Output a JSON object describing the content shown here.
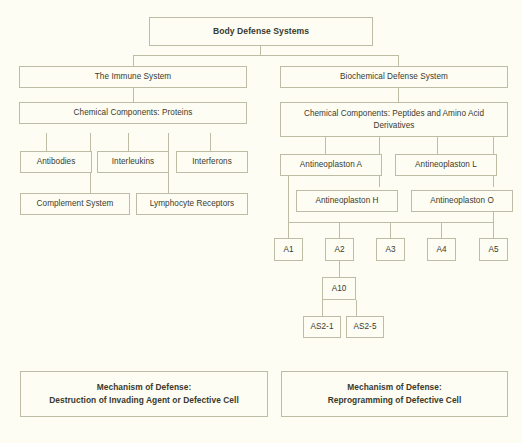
{
  "diagram": {
    "title": "Body Defense Systems",
    "type": "hierarchy-tree",
    "background_color": "#fdfdf3",
    "border_color": "#bdbda6",
    "text_color": "#3a3a2e",
    "nodes": {
      "root": "Body Defense Systems",
      "immune_system": "The Immune System",
      "biochemical_defense": "Biochemical Defense System",
      "chem_proteins": "Chemical Components: Proteins",
      "chem_peptides": "Chemical Components: Peptides and Amino Acid Derivatives",
      "antibodies": "Antibodies",
      "interleukins": "Interleukins",
      "interferons": "Interferons",
      "complement_system": "Complement System",
      "lymphocyte_receptors": "Lymphocyte Receptors",
      "antineoplaston_a": "Antineoplaston A",
      "antineoplaston_l": "Antineoplaston L",
      "antineoplaston_h": "Antineoplaston H",
      "antineoplaston_o": "Antineoplaston O",
      "a1": "A1",
      "a2": "A2",
      "a3": "A3",
      "a4": "A4",
      "a5": "A5",
      "a10": "A10",
      "as2_1": "AS2-1",
      "as2_5": "AS2-5",
      "mechanism_left_line1": "Mechanism of Defense:",
      "mechanism_left_line2": "Destruction of Invading Agent or Defective Cell",
      "mechanism_right_line1": "Mechanism of Defense:",
      "mechanism_right_line2": "Reprogramming of Defective Cell"
    }
  }
}
